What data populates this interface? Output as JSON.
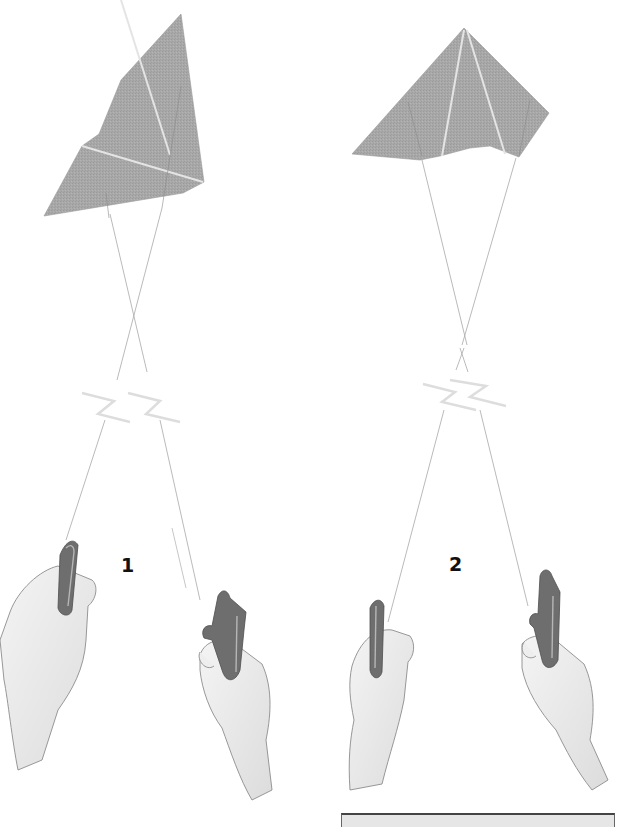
{
  "figure": {
    "type": "instructional-illustration",
    "panels": [
      {
        "label": "1",
        "kite": "tilted delta kite, banking left",
        "lines": "crossed",
        "break_symbol": "line-break-zigzag",
        "hands": [
          "left hand holding handle",
          "right hand holding handle pulled back"
        ]
      },
      {
        "label": "2",
        "kite": "level delta kite",
        "lines": "crossed",
        "break_symbol": "line-break-zigzag",
        "hands": [
          "left hand holding handle",
          "right hand holding handle"
        ]
      }
    ]
  },
  "caption_box": {
    "text": ""
  },
  "colors": {
    "kite_fill": "#a9a9a9",
    "kite_seam": "#e4e4e4",
    "line": "#9a9a9a",
    "handle": "#6e6e6e",
    "hand_outline": "#8c8c8c",
    "label": "#111111",
    "caption_fill": "#e6e6e6",
    "caption_border": "#444444"
  }
}
